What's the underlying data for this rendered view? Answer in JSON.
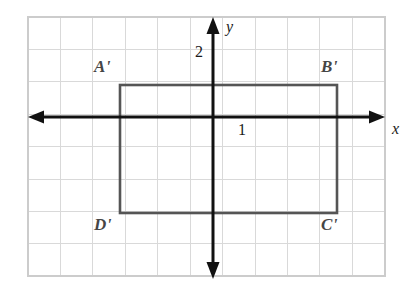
{
  "figure": {
    "background_color": "#ffffff",
    "grid": {
      "line_color": "#d8d8d8",
      "border_color": "#cfcfcf",
      "cell_size_px": 32.4,
      "columns": 11,
      "rows": 8,
      "left_px": 28,
      "top_px": 17,
      "right_px": 385,
      "bottom_px": 276
    },
    "axes": {
      "color": "#111111",
      "origin_px": {
        "x": 213,
        "y": 117
      },
      "x_axis": {
        "label": "x",
        "arrow_left": true,
        "arrow_right": true
      },
      "y_axis": {
        "label": "y",
        "arrow_up": true,
        "arrow_down": true
      },
      "tick_labels": [
        {
          "text": "2",
          "axis": "y",
          "value": 2
        },
        {
          "text": "1",
          "axis": "x",
          "value": 1
        }
      ]
    },
    "shape": {
      "name": "rectangle",
      "stroke_color": "#555555",
      "fill": "none",
      "stroke_width_px": 2.5,
      "vertices": [
        {
          "label": "A'",
          "x": -3,
          "y": 1,
          "px": {
            "x": 120,
            "y": 85
          }
        },
        {
          "label": "B'",
          "x": 4,
          "y": 1,
          "px": {
            "x": 337,
            "y": 85
          }
        },
        {
          "label": "C'",
          "x": 4,
          "y": -3,
          "px": {
            "x": 337,
            "y": 213
          }
        },
        {
          "label": "D'",
          "x": -3,
          "y": -3,
          "px": {
            "x": 120,
            "y": 213
          }
        }
      ]
    },
    "labels": {
      "a_prime": "A'",
      "b_prime": "B'",
      "c_prime": "C'",
      "d_prime": "D'",
      "x_axis": "x",
      "y_axis": "y",
      "tick_two": "2",
      "tick_one": "1"
    }
  }
}
